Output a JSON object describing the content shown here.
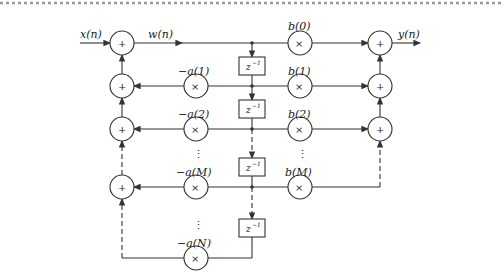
{
  "diagram": {
    "input_label": "x(n)",
    "state_label": "w(n)",
    "output_label": "y(n)",
    "adder_symbol": "+",
    "multiplier_symbol": "×",
    "delay_label": "z",
    "delay_exponent": "−1",
    "vertical_ellipsis": "⋮",
    "feedback_coefficients": [
      "−a(1)",
      "−a(2)",
      "−a(M)",
      "−a(N)"
    ],
    "feedforward_coefficients": [
      "b(0)",
      "b(1)",
      "b(2)",
      "b(M)"
    ],
    "colors": {
      "line": "#333333",
      "background": "#ffffff",
      "border": "#9a9a9a"
    }
  }
}
